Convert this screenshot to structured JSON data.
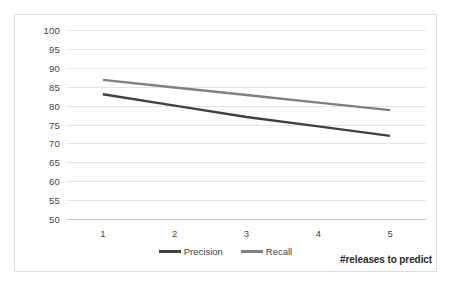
{
  "chart_data": {
    "type": "line",
    "title": "",
    "xlabel": "#releases to predict",
    "ylabel": "",
    "categories": [
      "1",
      "2",
      "3",
      "4",
      "5"
    ],
    "series": [
      {
        "name": "Precision",
        "color": "#404040",
        "values": [
          83,
          80,
          77,
          74.5,
          72
        ]
      },
      {
        "name": "Recall",
        "color": "#808080",
        "values": [
          86.8,
          84.8,
          82.8,
          80.8,
          78.8
        ]
      }
    ],
    "ylim": [
      50,
      100
    ],
    "ystep": 5,
    "yticks": [
      100,
      95,
      90,
      85,
      80,
      75,
      70,
      65,
      60,
      55,
      50
    ],
    "grid": true,
    "legend_position": "bottom",
    "plot_background": "#ffffff",
    "gridline_color": "#e4e4e4",
    "border_color": "#dcdcdc"
  }
}
